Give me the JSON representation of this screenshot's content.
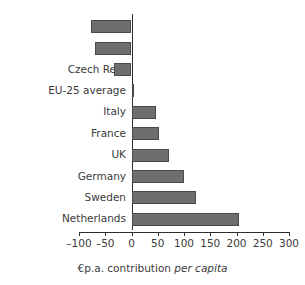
{
  "chart_data": {
    "type": "bar",
    "orientation": "horizontal",
    "title": "",
    "xlabel": "€p.a. contribution per capita",
    "xlabel_plain": "€p.a. contribution ",
    "xlabel_italic": "per capita",
    "ylabel": "",
    "categories": [
      "Poland",
      "Spain",
      "Czech Rep.",
      "EU-25 average",
      "Italy",
      "France",
      "UK",
      "Germany",
      "Sweden",
      "Netherlands"
    ],
    "values": [
      -77,
      -69,
      -33,
      5,
      46,
      52,
      71,
      100,
      122,
      205
    ],
    "xlim": [
      -100,
      300
    ],
    "xticks": [
      -100,
      -50,
      0,
      50,
      100,
      150,
      200,
      250,
      300
    ],
    "xtick_labels": [
      "–100",
      "–50",
      "0",
      "50",
      "100",
      "150",
      "200",
      "250",
      "300"
    ],
    "grid": false,
    "legend": false,
    "bar_color": "#6e6e6e",
    "bar_edge_color": "#4a4a4a",
    "axis_color": "#2d2d2d",
    "zero_line": 0
  }
}
